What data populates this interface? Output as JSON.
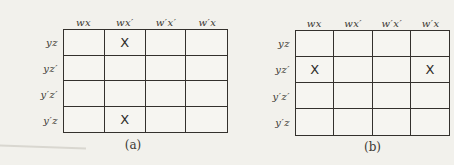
{
  "palette": {
    "background": "#f2f1ec",
    "grid_line": "#34312d",
    "text": "#3b3833"
  },
  "mark_symbol": "X",
  "maps": [
    {
      "caption": "(a)",
      "col_headers": [
        "wx",
        "wx′",
        "w′x′",
        "w′x"
      ],
      "row_headers": [
        "yz",
        "yz′",
        "y′z′",
        "y′z"
      ],
      "cells": [
        [
          "",
          "X",
          "",
          ""
        ],
        [
          "",
          "",
          "",
          ""
        ],
        [
          "",
          "",
          "",
          ""
        ],
        [
          "",
          "X",
          "",
          ""
        ]
      ]
    },
    {
      "caption": "(b)",
      "col_headers": [
        "wx",
        "wx′",
        "w′x′",
        "w′x"
      ],
      "row_headers": [
        "yz",
        "yz′",
        "y′z′",
        "y′z"
      ],
      "cells": [
        [
          "",
          "",
          "",
          ""
        ],
        [
          "X",
          "",
          "",
          "X"
        ],
        [
          "",
          "",
          "",
          ""
        ],
        [
          "",
          "",
          "",
          ""
        ]
      ]
    }
  ]
}
